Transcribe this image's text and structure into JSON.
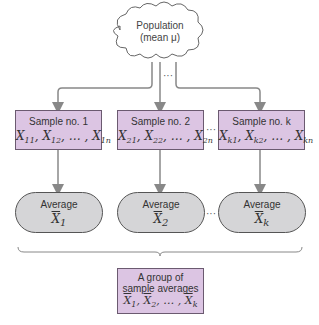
{
  "population": {
    "line1": "Population",
    "line2": "(mean μ)"
  },
  "samples": [
    {
      "title": "Sample no. 1",
      "x": "X",
      "s1": "11",
      "s2": "12",
      "sn": "1n"
    },
    {
      "title": "Sample no. 2",
      "x": "X",
      "s1": "21",
      "s2": "22",
      "sn": "2n"
    },
    {
      "title": "Sample no. k",
      "x": "X",
      "s1": "k1",
      "s2": "k2",
      "sn": "kn"
    }
  ],
  "averages": [
    {
      "title": "Average",
      "var": "X",
      "sub": "1"
    },
    {
      "title": "Average",
      "var": "X",
      "sub": "2"
    },
    {
      "title": "Average",
      "var": "X",
      "sub": "k"
    }
  ],
  "ellipsis": "···",
  "list_sep": ", … , ",
  "group": {
    "line1": "A group of",
    "line2": "sample averages",
    "var": "X",
    "s1": "1",
    "s2": "2",
    "sk": "k"
  },
  "colors": {
    "sample_fill": "#dcc5e3",
    "average_fill": "#d5d5d7",
    "arrow": "#888888"
  }
}
